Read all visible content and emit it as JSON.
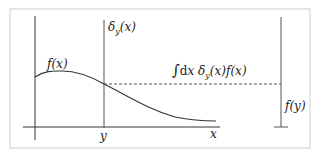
{
  "diagram": {
    "labels": {
      "fx": "f(x)",
      "delta": "δ_y(x)",
      "integral": "∫dx δ_y(x) f(x)",
      "y_tick": "y",
      "x_axis": "x",
      "fy": "f(y)"
    },
    "colors": {
      "line": "#333333",
      "border": "#cccccc",
      "background": "#ffffff"
    }
  }
}
